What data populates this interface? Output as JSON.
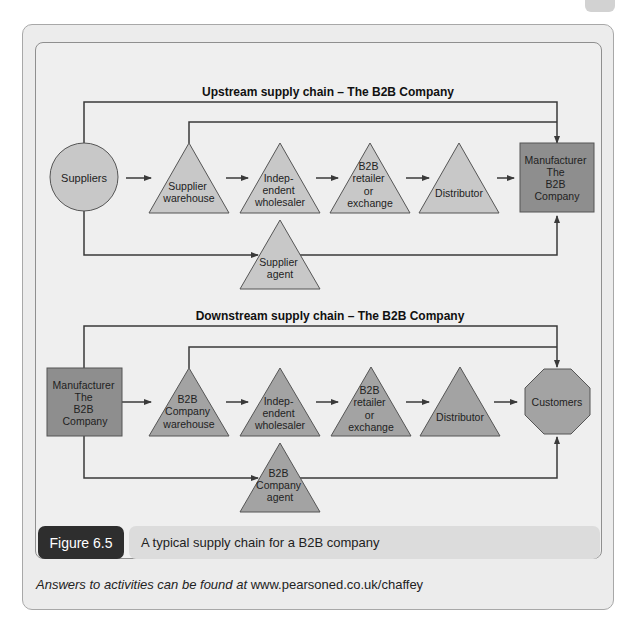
{
  "upstream": {
    "title": "Upstream supply chain – The B2B Company",
    "nodes": {
      "suppliers": "Suppliers",
      "supplier_warehouse": [
        "Supplier",
        "warehouse"
      ],
      "wholesaler": [
        "Indep-",
        "endent",
        "wholesaler"
      ],
      "retailer": [
        "B2B",
        "retailer",
        "or",
        "exchange"
      ],
      "distributor": "Distributor",
      "manufacturer": [
        "Manufacturer",
        "The",
        "B2B",
        "Company"
      ],
      "agent": [
        "Supplier",
        "agent"
      ]
    }
  },
  "downstream": {
    "title": "Downstream supply chain – The B2B Company",
    "nodes": {
      "manufacturer": [
        "Manufacturer",
        "The",
        "B2B",
        "Company"
      ],
      "warehouse": [
        "B2B",
        "Company",
        "warehouse"
      ],
      "wholesaler": [
        "Indep-",
        "endent",
        "wholesaler"
      ],
      "retailer": [
        "B2B",
        "retailer",
        "or",
        "exchange"
      ],
      "distributor": "Distributor",
      "customers": "Customers",
      "agent": [
        "B2B",
        "Company",
        "agent"
      ]
    }
  },
  "figure": {
    "label": "Figure 6.5",
    "caption": "A typical supply chain for a B2B company"
  },
  "footer": {
    "prefix": "Answers to activities can be found at",
    "url": "www.pearsoned.co.uk/chaffey"
  },
  "colors": {
    "upstream_fill": "#c8c8c8",
    "downstream_fill": "#a3a3a3",
    "manufacturer_fill": "#8e8e8e",
    "line": "#3a3a3a",
    "figure_tab": "#2e2e2e",
    "caption_bg": "#dcdcdc"
  }
}
